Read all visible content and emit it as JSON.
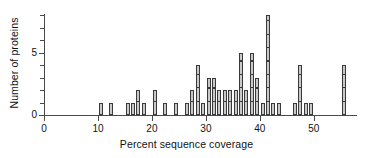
{
  "chart_data": {
    "type": "bar",
    "title": "",
    "subtitle": "",
    "xlabel": "Percent sequence coverage",
    "ylabel": "Number of proteins",
    "xlim": [
      0,
      58
    ],
    "ylim": [
      0,
      8
    ],
    "grid": false,
    "legend": null,
    "bin_width": 1,
    "x_ticks": [
      0,
      10,
      20,
      30,
      40,
      50
    ],
    "x_tick_labels": [
      "0",
      "10",
      "20",
      "30",
      "40",
      "50"
    ],
    "x_minor_ticks": [
      5,
      15,
      25,
      35,
      45,
      55
    ],
    "y_ticks": [
      0,
      5
    ],
    "y_tick_labels": [
      "0",
      "5"
    ],
    "y_minor_ticks": [
      1,
      2,
      3,
      4,
      6,
      7,
      8
    ],
    "categories": [
      10.5,
      12.5,
      15.5,
      16.5,
      17.5,
      18.5,
      20.5,
      22.5,
      24.5,
      26.5,
      27.5,
      28.5,
      29.5,
      30.5,
      31.5,
      32.5,
      33.5,
      34.5,
      35.5,
      36.5,
      37.5,
      38.5,
      39.5,
      40.5,
      41.5,
      42.5,
      43.5,
      46.5,
      47.5,
      48.5,
      49.5,
      55.5
    ],
    "values": [
      1,
      1,
      1,
      1,
      2,
      1,
      2,
      1,
      1,
      1,
      2,
      4,
      1,
      3,
      3,
      2,
      2,
      2,
      2,
      5,
      2,
      5,
      3,
      1,
      8,
      1,
      1,
      1,
      4,
      1,
      1,
      4
    ],
    "bar_color": "#c9c9c9",
    "bar_edge_color": "#3a3a3a",
    "axis_color": "#4a4a4a",
    "background_color": "#ffffff"
  }
}
